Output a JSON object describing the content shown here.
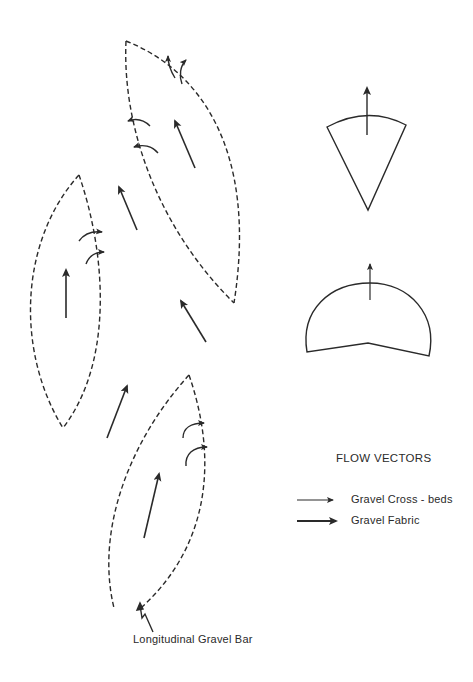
{
  "diagram": {
    "type": "geological-sketch",
    "legend": {
      "title": "FLOW VECTORS",
      "items": [
        {
          "symbol": "thin-arrow",
          "label": "Gravel Cross - beds"
        },
        {
          "symbol": "thick-arrow",
          "label": "Gravel Fabric"
        }
      ]
    },
    "annotation": {
      "label": "Longitudinal Gravel Bar"
    },
    "bars": [
      {
        "id": "upper-bar",
        "fabric_arrows": 1,
        "cross_bed_arcs": 4
      },
      {
        "id": "left-bar",
        "fabric_arrows": 1,
        "cross_bed_arcs": 2
      },
      {
        "id": "lower-bar",
        "fabric_arrows": 1,
        "cross_bed_arcs": 2
      }
    ],
    "inter_bar_fabric_arrows": 3,
    "rose_diagrams": [
      {
        "id": "fan-rose",
        "shape": "sector",
        "direction": "north"
      },
      {
        "id": "semicircle-rose",
        "shape": "semicircle",
        "direction": "north"
      }
    ],
    "colors": {
      "line": "#2a2a2a",
      "background": "#ffffff"
    }
  }
}
